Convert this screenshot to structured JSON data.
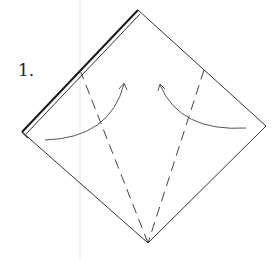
{
  "diagram": {
    "step_label": "1.",
    "colors": {
      "paper_edge": "#333333",
      "thick_edge": "#1a1a1a",
      "fold_line": "#444444",
      "arrow": "#555555",
      "guide_line": "#e6e6e6"
    },
    "elements": {
      "paper": "square-diamond",
      "fold_lines": [
        "left-valley-fold",
        "right-valley-fold"
      ],
      "arrows": [
        "left-fold-arrow",
        "right-fold-arrow"
      ]
    }
  }
}
